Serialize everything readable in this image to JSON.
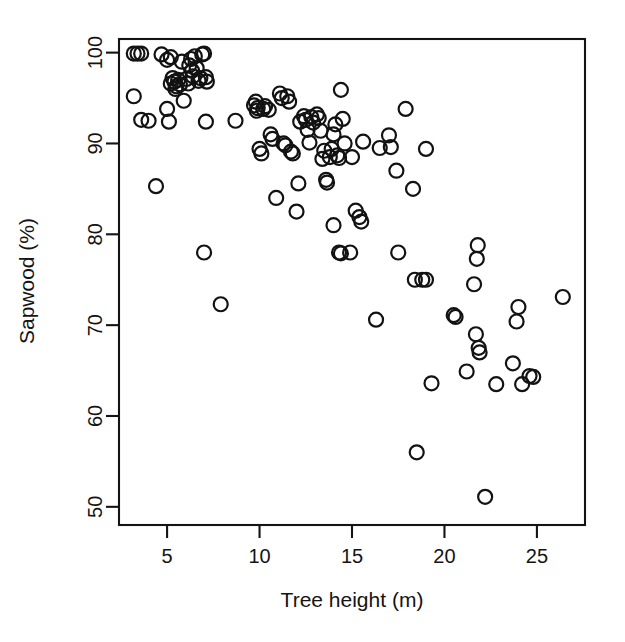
{
  "figure": {
    "background_color": "#ffffff",
    "foreground_color": "#141414",
    "marker": {
      "shape": "open-circle",
      "radius_px": 7,
      "stroke_color": "#121212"
    }
  },
  "axes": {
    "x_axis": {
      "title": "Tree height (m)",
      "tick_labels": [
        "5",
        "10",
        "15",
        "20",
        "25"
      ],
      "tick_values": [
        5,
        10,
        15,
        20,
        25
      ],
      "range": [
        2.4,
        27.6
      ]
    },
    "y_axis": {
      "title": "Sapwood (%)",
      "tick_labels": [
        "50",
        "60",
        "70",
        "80",
        "90",
        "100"
      ],
      "tick_values": [
        50,
        60,
        70,
        80,
        90,
        100
      ],
      "range": [
        48.0,
        101.5
      ]
    }
  },
  "chart_data": {
    "type": "scatter",
    "title": "",
    "subtitle": "",
    "xlabel": "Tree height (m)",
    "ylabel": "Sapwood (%)",
    "xlim": [
      2.4,
      27.6
    ],
    "ylim": [
      48.0,
      101.5
    ],
    "xticks": [
      5,
      10,
      15,
      20,
      25
    ],
    "yticks": [
      50,
      60,
      70,
      80,
      90,
      100
    ],
    "grid": false,
    "legend": null,
    "marker_style": "open-circle",
    "n_points": 116,
    "series": [
      {
        "name": "Sapwood vs tree height",
        "points": [
          [
            3.2,
            99.9
          ],
          [
            3.4,
            99.9
          ],
          [
            3.6,
            99.9
          ],
          [
            3.2,
            95.2
          ],
          [
            3.6,
            92.6
          ],
          [
            4.0,
            92.5
          ],
          [
            4.4,
            85.3
          ],
          [
            4.7,
            99.8
          ],
          [
            5.0,
            99.2
          ],
          [
            5.2,
            96.6
          ],
          [
            5.3,
            97.2
          ],
          [
            5.0,
            93.8
          ],
          [
            5.1,
            92.4
          ],
          [
            5.4,
            96.8
          ],
          [
            5.5,
            96.3
          ],
          [
            5.6,
            97.0
          ],
          [
            5.7,
            96.5
          ],
          [
            5.8,
            99.0
          ],
          [
            5.9,
            94.7
          ],
          [
            5.2,
            99.5
          ],
          [
            5.45,
            96.0
          ],
          [
            6.2,
            98.6
          ],
          [
            6.3,
            99.3
          ],
          [
            6.35,
            98.0
          ],
          [
            6.4,
            97.4
          ],
          [
            6.5,
            99.6
          ],
          [
            6.6,
            98.3
          ],
          [
            6.7,
            96.9
          ],
          [
            6.8,
            97.2
          ],
          [
            6.9,
            99.8
          ],
          [
            7.0,
            99.9
          ],
          [
            7.1,
            97.3
          ],
          [
            7.15,
            96.8
          ],
          [
            6.05,
            97.1
          ],
          [
            6.15,
            96.6
          ],
          [
            7.0,
            78.0
          ],
          [
            7.1,
            92.4
          ],
          [
            7.9,
            72.3
          ],
          [
            8.7,
            92.5
          ],
          [
            9.7,
            94.2
          ],
          [
            9.8,
            94.6
          ],
          [
            9.85,
            93.6
          ],
          [
            9.9,
            93.9
          ],
          [
            10.0,
            89.4
          ],
          [
            10.1,
            88.9
          ],
          [
            10.2,
            93.8
          ],
          [
            10.3,
            94.1
          ],
          [
            10.5,
            93.7
          ],
          [
            10.6,
            91.0
          ],
          [
            10.7,
            90.5
          ],
          [
            10.9,
            84.0
          ],
          [
            11.1,
            95.5
          ],
          [
            11.2,
            95.0
          ],
          [
            11.3,
            90.0
          ],
          [
            11.4,
            89.8
          ],
          [
            11.5,
            95.2
          ],
          [
            11.6,
            94.6
          ],
          [
            11.7,
            89.1
          ],
          [
            11.8,
            88.9
          ],
          [
            12.0,
            82.5
          ],
          [
            12.1,
            85.6
          ],
          [
            12.2,
            92.4
          ],
          [
            12.4,
            93.0
          ],
          [
            12.5,
            92.6
          ],
          [
            12.6,
            91.5
          ],
          [
            12.7,
            90.1
          ],
          [
            12.8,
            92.9
          ],
          [
            12.9,
            92.3
          ],
          [
            13.1,
            93.2
          ],
          [
            13.2,
            92.8
          ],
          [
            13.3,
            91.4
          ],
          [
            13.4,
            88.3
          ],
          [
            13.5,
            89.2
          ],
          [
            13.6,
            86.0
          ],
          [
            13.65,
            85.7
          ],
          [
            13.8,
            88.5
          ],
          [
            13.9,
            89.4
          ],
          [
            14.0,
            91.0
          ],
          [
            14.1,
            92.1
          ],
          [
            14.2,
            88.7
          ],
          [
            14.3,
            88.4
          ],
          [
            14.4,
            95.9
          ],
          [
            14.5,
            92.7
          ],
          [
            14.6,
            90.0
          ],
          [
            14.0,
            81.0
          ],
          [
            14.3,
            78.0
          ],
          [
            14.4,
            77.9
          ],
          [
            14.9,
            78.0
          ],
          [
            15.0,
            88.5
          ],
          [
            15.2,
            82.6
          ],
          [
            15.4,
            81.9
          ],
          [
            15.5,
            81.4
          ],
          [
            15.6,
            90.2
          ],
          [
            16.3,
            70.6
          ],
          [
            16.5,
            89.5
          ],
          [
            17.0,
            90.9
          ],
          [
            17.1,
            89.6
          ],
          [
            17.4,
            87.0
          ],
          [
            17.5,
            78.0
          ],
          [
            17.9,
            93.8
          ],
          [
            18.3,
            85.0
          ],
          [
            18.4,
            75.0
          ],
          [
            18.8,
            75.0
          ],
          [
            19.0,
            75.0
          ],
          [
            18.5,
            56.0
          ],
          [
            19.0,
            89.4
          ],
          [
            19.3,
            63.6
          ],
          [
            20.5,
            71.1
          ],
          [
            20.6,
            70.9
          ],
          [
            21.2,
            64.9
          ],
          [
            21.6,
            74.5
          ],
          [
            21.7,
            69.0
          ],
          [
            21.75,
            77.3
          ],
          [
            21.8,
            78.8
          ],
          [
            21.85,
            67.5
          ],
          [
            21.9,
            67.0
          ],
          [
            22.2,
            51.1
          ],
          [
            22.8,
            63.5
          ],
          [
            23.7,
            65.8
          ],
          [
            23.9,
            70.4
          ],
          [
            24.0,
            72.0
          ],
          [
            24.2,
            63.5
          ],
          [
            24.6,
            64.4
          ],
          [
            24.8,
            64.3
          ],
          [
            26.4,
            73.1
          ]
        ]
      }
    ]
  }
}
